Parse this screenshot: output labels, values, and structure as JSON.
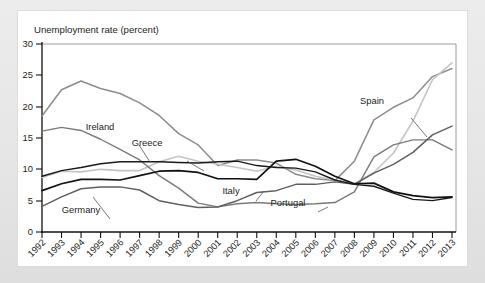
{
  "figure": {
    "axis_title": "Unemployment rate (percent)",
    "background_color": "#e8e8e8",
    "card_color": "#ffffff"
  },
  "chart_data": {
    "type": "line",
    "title": "Unemployment rate (percent)",
    "xlabel": "",
    "ylabel": "Unemployment rate (percent)",
    "ylim": [
      0,
      30
    ],
    "yticks": [
      0,
      5,
      10,
      15,
      20,
      25,
      30
    ],
    "grid": false,
    "legend": "inline-labels",
    "x": [
      1992,
      1993,
      1994,
      1995,
      1996,
      1997,
      1998,
      1999,
      2000,
      2001,
      2002,
      2003,
      2004,
      2005,
      2006,
      2007,
      2008,
      2009,
      2010,
      2011,
      2012,
      2013
    ],
    "categories": [
      "1992",
      "1993",
      "1994",
      "1995",
      "1996",
      "1997",
      "1998",
      "1999",
      "2000",
      "2001",
      "2002",
      "2003",
      "2004",
      "2005",
      "2006",
      "2007",
      "2008",
      "2009",
      "2010",
      "2011",
      "2012",
      "2013"
    ],
    "series": [
      {
        "name": "Spain",
        "color": "#8c8c8c",
        "width": 1.5,
        "values": [
          18.5,
          22.7,
          24.1,
          22.9,
          22.1,
          20.6,
          18.6,
          15.7,
          13.9,
          10.6,
          11.5,
          11.5,
          11.0,
          9.2,
          8.5,
          8.2,
          11.3,
          17.9,
          19.9,
          21.4,
          24.8,
          26.1
        ]
      },
      {
        "name": "Greece",
        "color": "#c4c4c4",
        "width": 1.6,
        "values": [
          8.7,
          9.7,
          9.6,
          10.0,
          9.8,
          9.8,
          11.2,
          12.1,
          11.3,
          10.8,
          10.3,
          9.7,
          10.5,
          9.9,
          8.9,
          8.3,
          7.7,
          9.5,
          12.6,
          17.7,
          24.3,
          27.0
        ]
      },
      {
        "name": "Ireland",
        "color": "#7a7a7a",
        "width": 1.4,
        "values": [
          16.1,
          16.7,
          16.2,
          14.8,
          13.2,
          11.5,
          9.0,
          7.0,
          4.6,
          4.0,
          4.5,
          4.7,
          4.5,
          4.4,
          4.5,
          4.7,
          6.4,
          12.0,
          13.9,
          14.7,
          14.7,
          13.1
        ]
      },
      {
        "name": "Portugal",
        "color": "#5f5f5f",
        "width": 1.5,
        "values": [
          4.1,
          5.6,
          6.9,
          7.2,
          7.2,
          6.7,
          5.0,
          4.4,
          3.9,
          4.0,
          5.0,
          6.3,
          6.6,
          7.6,
          7.6,
          8.0,
          7.6,
          9.4,
          10.8,
          12.7,
          15.5,
          16.9
        ]
      },
      {
        "name": "Italy",
        "color": "#111111",
        "width": 1.7,
        "values": [
          6.6,
          7.7,
          8.4,
          8.4,
          8.3,
          9.0,
          9.7,
          9.8,
          9.5,
          8.5,
          8.5,
          8.4,
          11.3,
          11.6,
          10.5,
          8.9,
          7.7,
          7.8,
          6.4,
          5.8,
          5.5,
          5.6
        ]
      },
      {
        "name": "Germany",
        "color": "#1a1a1a",
        "width": 1.4,
        "values": [
          8.9,
          9.8,
          10.3,
          10.9,
          11.2,
          11.2,
          11.2,
          11.1,
          11.0,
          11.2,
          11.3,
          10.6,
          10.3,
          10.2,
          9.6,
          8.3,
          7.6,
          7.3,
          6.2,
          5.2,
          5.0,
          5.5
        ]
      }
    ],
    "annotations": [
      {
        "text": "Spain",
        "x": 372,
        "y": 104
      },
      {
        "text": "Ireland",
        "x": 100,
        "y": 130
      },
      {
        "text": "Greece",
        "x": 147,
        "y": 146
      },
      {
        "text": "Italy",
        "x": 231,
        "y": 194
      },
      {
        "text": "Portugal",
        "x": 288,
        "y": 206
      },
      {
        "text": "Germany",
        "x": 81,
        "y": 213
      }
    ]
  }
}
